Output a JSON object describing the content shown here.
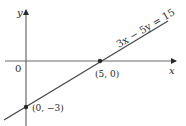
{
  "figure": {
    "axes": {
      "x_label": "x",
      "y_label": "y",
      "origin_label": "0"
    },
    "line": {
      "equation": "3x − 5y = 15",
      "color": "#4a4a4a"
    },
    "points": [
      {
        "label": "(5, 0)",
        "x": 5,
        "y": 0
      },
      {
        "label": "(0, −3)",
        "x": 0,
        "y": -3
      }
    ],
    "axis_color": "#3a3a3a"
  }
}
